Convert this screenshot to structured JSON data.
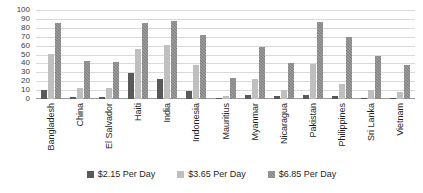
{
  "chart_data": {
    "type": "bar",
    "title": "",
    "xlabel": "",
    "ylabel": "",
    "ylim": [
      0,
      100
    ],
    "yticks": [
      100,
      90,
      80,
      70,
      60,
      50,
      40,
      30,
      20,
      10,
      0
    ],
    "grid": true,
    "legend_position": "bottom",
    "categories": [
      "Bangladesh",
      "China",
      "El Salvador",
      "Haiti",
      "India",
      "Indonesia",
      "Mauritius",
      "Myanmar",
      "Nicaragua",
      "Pakistan",
      "Philippines",
      "Sri Lanka",
      "Vietnam"
    ],
    "series": [
      {
        "name": "$2.15 Per Day",
        "color": "#595959",
        "values": [
          10,
          2,
          2,
          29,
          22,
          9,
          1,
          4,
          3,
          5,
          3,
          1,
          1
        ]
      },
      {
        "name": "$3.65 Per Day",
        "color": "#bfbfbf",
        "values": [
          51,
          12,
          12,
          56,
          61,
          38,
          3,
          22,
          10,
          39,
          17,
          10,
          8
        ]
      },
      {
        "name": "$6.85 Per Day",
        "color": "#808080",
        "values": [
          85,
          43,
          42,
          85,
          88,
          72,
          24,
          58,
          40,
          87,
          70,
          48,
          38
        ]
      }
    ]
  }
}
